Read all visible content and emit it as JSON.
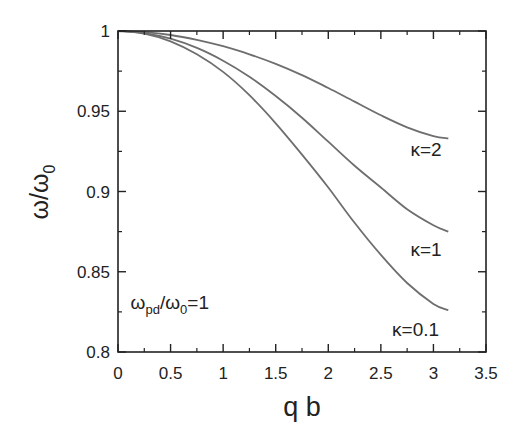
{
  "chart_data": {
    "type": "line",
    "title": "",
    "xlabel": "q b",
    "ylabel": "ω/ω0",
    "ylabel_main": "ω/ω",
    "ylabel_sub": "0",
    "xlim": [
      0,
      3.5
    ],
    "ylim": [
      0.8,
      1.0
    ],
    "xticks": [
      0,
      0.5,
      1,
      1.5,
      2,
      2.5,
      3,
      3.5
    ],
    "xtick_labels": [
      "0",
      "0.5",
      "1",
      "1.5",
      "2",
      "2.5",
      "3",
      "3.5"
    ],
    "yticks": [
      0.8,
      0.85,
      0.9,
      0.95,
      1.0
    ],
    "ytick_labels": [
      "0.8",
      "0.85",
      "0.9",
      "0.95",
      "1"
    ],
    "grid": false,
    "legend": "inline labels",
    "annotation": {
      "text_main": "ω",
      "text_sub1": "pd",
      "text_mid": "/ω",
      "text_sub2": "0",
      "text_tail": "=1",
      "full": "ωpd/ω0=1",
      "x": 0.12,
      "y": 0.8265
    },
    "line_color": "#6e6e6e",
    "series": [
      {
        "name": "κ=2",
        "label": "κ=2",
        "label_pos": [
          2.93,
          0.922
        ],
        "x": [
          0,
          0.25,
          0.5,
          0.75,
          1.0,
          1.25,
          1.5,
          1.75,
          2.0,
          2.25,
          2.5,
          2.75,
          3.0,
          3.1416
        ],
        "values": [
          1.0,
          0.9993,
          0.9975,
          0.9945,
          0.9905,
          0.9855,
          0.9795,
          0.9725,
          0.9645,
          0.956,
          0.9475,
          0.94,
          0.9345,
          0.933
        ]
      },
      {
        "name": "κ=1",
        "label": "κ=1",
        "label_pos": [
          2.93,
          0.86
        ],
        "x": [
          0,
          0.25,
          0.5,
          0.75,
          1.0,
          1.25,
          1.5,
          1.75,
          2.0,
          2.25,
          2.5,
          2.75,
          3.0,
          3.1416
        ],
        "values": [
          1.0,
          0.9987,
          0.9952,
          0.9895,
          0.9815,
          0.9715,
          0.9595,
          0.946,
          0.931,
          0.916,
          0.9025,
          0.889,
          0.879,
          0.875
        ]
      },
      {
        "name": "κ=0.1",
        "label": "κ=0.1",
        "label_pos": [
          2.83,
          0.81
        ],
        "x": [
          0,
          0.25,
          0.5,
          0.75,
          1.0,
          1.25,
          1.5,
          1.75,
          2.0,
          2.25,
          2.5,
          2.75,
          3.0,
          3.1416
        ],
        "values": [
          1.0,
          0.9983,
          0.9935,
          0.9855,
          0.9745,
          0.96,
          0.9425,
          0.923,
          0.9025,
          0.8805,
          0.8605,
          0.843,
          0.83,
          0.826
        ]
      }
    ]
  }
}
